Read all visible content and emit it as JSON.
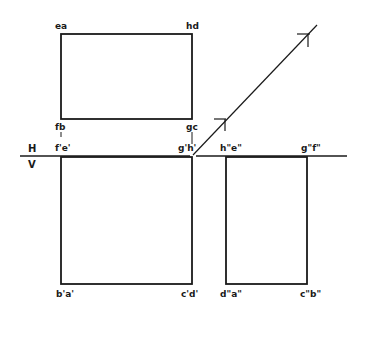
{
  "diagram": {
    "type": "orthographic-projection",
    "reference_line": {
      "above": "H",
      "below": "V"
    },
    "top_view": {
      "corner_labels": {
        "top_left": "ea",
        "top_right": "hd",
        "bottom_left": "fb",
        "bottom_right": "gc"
      }
    },
    "front_view": {
      "corner_labels": {
        "top_left": "f'e'",
        "top_right": "g'h'",
        "bottom_left": "b'a'",
        "bottom_right": "c'd'"
      }
    },
    "side_view": {
      "corner_labels": {
        "top_left": "h\"e\"",
        "top_right": "g\"f\"",
        "bottom_left": "d\"a\"",
        "bottom_right": "c\"b\""
      }
    },
    "colors": {
      "line": "#1a1a1a",
      "background": "#ffffff"
    }
  }
}
